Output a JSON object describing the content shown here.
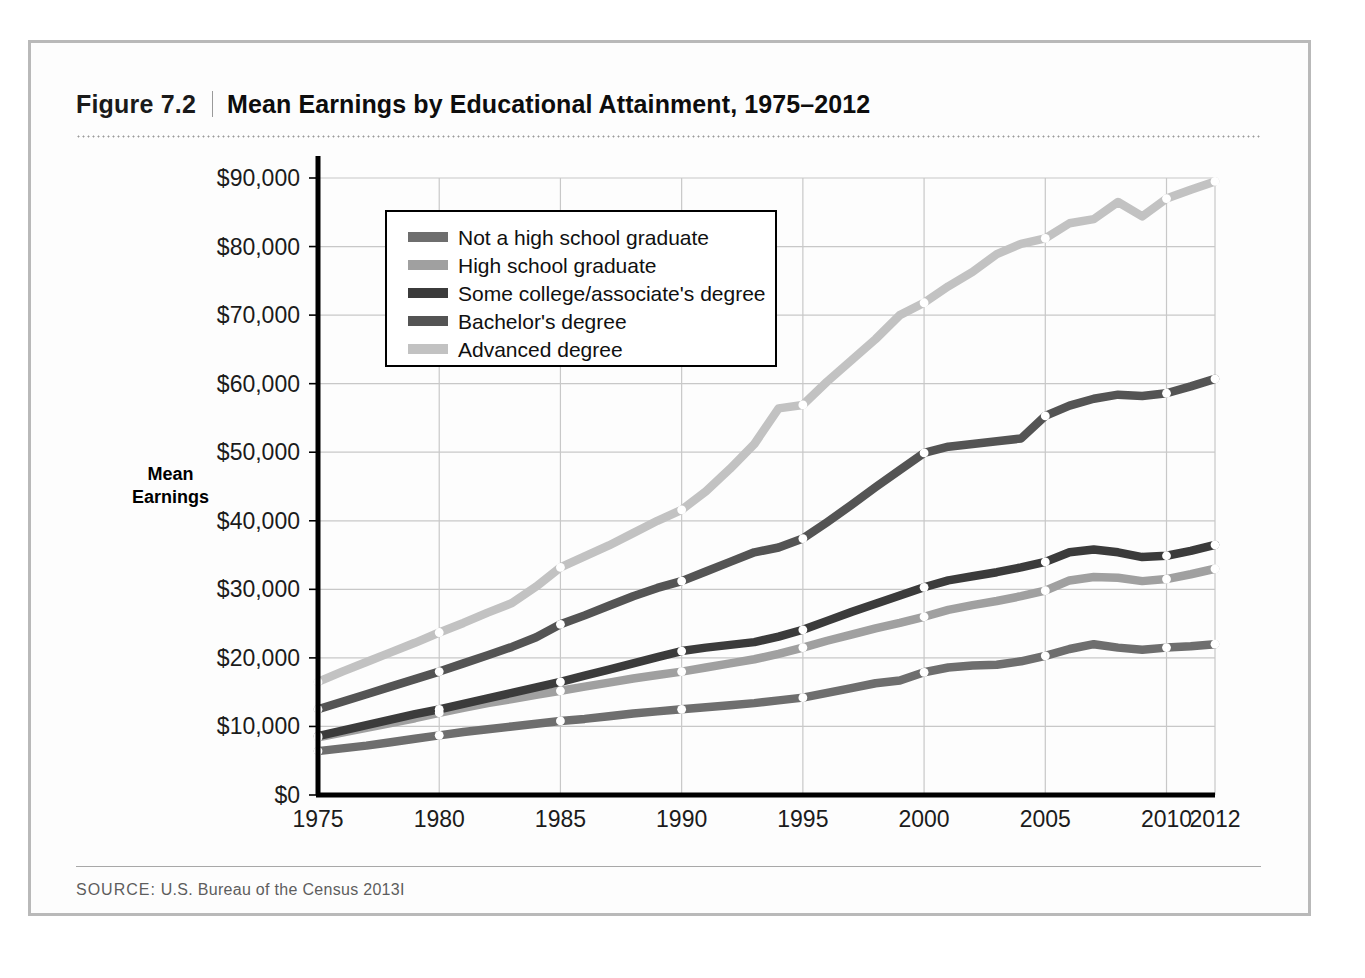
{
  "figure": {
    "number": "Figure 7.2",
    "title": "Mean Earnings by Educational Attainment, 1975–2012",
    "source_label": "SOURCE:",
    "source_text": " U.S. Bureau of the Census 2013I"
  },
  "axis": {
    "y_title_line1": "Mean",
    "y_title_line2": "Earnings"
  },
  "colors": {
    "not_hs": "#6e6e6e",
    "hs": "#a0a0a0",
    "some_college": "#3b3b3b",
    "bachelors": "#545454",
    "advanced": "#c2c2c2",
    "axis": "#000000",
    "grid": "#c8c8c8",
    "frame": "#b9b9b9",
    "marker": "#ffffff"
  },
  "chart_data": {
    "type": "line",
    "title": "Mean Earnings by Educational Attainment, 1975–2012",
    "xlabel": "",
    "ylabel": "Mean Earnings",
    "xlim": [
      1975,
      2012
    ],
    "ylim": [
      0,
      90000
    ],
    "grid": true,
    "legend_position": "upper-left-inside",
    "ytick_labels": [
      "$0",
      "$10,000",
      "$20,000",
      "$30,000",
      "$40,000",
      "$50,000",
      "$60,000",
      "$70,000",
      "$80,000",
      "$90,000"
    ],
    "ytick_values": [
      0,
      10000,
      20000,
      30000,
      40000,
      50000,
      60000,
      70000,
      80000,
      90000
    ],
    "xtick_labels": [
      "1975",
      "1980",
      "1985",
      "1990",
      "1995",
      "2000",
      "2005",
      "2010",
      "2012"
    ],
    "xtick_values": [
      1975,
      1980,
      1985,
      1990,
      1995,
      2000,
      2005,
      2010,
      2012
    ],
    "marker_years": [
      1975,
      1980,
      1985,
      1990,
      1995,
      2000,
      2005,
      2010,
      2012
    ],
    "x": [
      1975,
      1976,
      1977,
      1978,
      1979,
      1980,
      1981,
      1982,
      1983,
      1984,
      1985,
      1986,
      1987,
      1988,
      1989,
      1990,
      1991,
      1992,
      1993,
      1994,
      1995,
      1996,
      1997,
      1998,
      1999,
      2000,
      2001,
      2002,
      2003,
      2004,
      2005,
      2006,
      2007,
      2008,
      2009,
      2010,
      2011,
      2012
    ],
    "series": [
      {
        "name": "Not a high school graduate",
        "color": "#6e6e6e",
        "values": [
          6400,
          6800,
          7200,
          7700,
          8200,
          8700,
          9200,
          9600,
          10000,
          10400,
          10800,
          11100,
          11500,
          11900,
          12200,
          12500,
          12800,
          13100,
          13400,
          13800,
          14200,
          14900,
          15600,
          16300,
          16700,
          17900,
          18600,
          18900,
          19000,
          19500,
          20300,
          21300,
          22000,
          21500,
          21200,
          21500,
          21700,
          22000
        ]
      },
      {
        "name": "High school graduate",
        "color": "#a0a0a0",
        "values": [
          8400,
          9100,
          9800,
          10500,
          11200,
          12000,
          12700,
          13400,
          14000,
          14600,
          15200,
          15800,
          16400,
          17000,
          17500,
          18000,
          18600,
          19200,
          19800,
          20600,
          21500,
          22500,
          23400,
          24300,
          25100,
          26000,
          27000,
          27700,
          28300,
          29000,
          29800,
          31300,
          31800,
          31700,
          31200,
          31500,
          32200,
          33000
        ]
      },
      {
        "name": "Some college/associate's degree",
        "color": "#3b3b3b",
        "values": [
          8600,
          9400,
          10200,
          11000,
          11800,
          12500,
          13300,
          14100,
          14900,
          15700,
          16500,
          17400,
          18300,
          19200,
          20100,
          21000,
          21500,
          21900,
          22300,
          23100,
          24100,
          25400,
          26700,
          27900,
          29100,
          30300,
          31300,
          31900,
          32500,
          33200,
          34000,
          35400,
          35800,
          35400,
          34700,
          34900,
          35600,
          36500
        ]
      },
      {
        "name": "Bachelor's degree",
        "color": "#545454",
        "values": [
          12500,
          13600,
          14700,
          15800,
          16900,
          18000,
          19200,
          20400,
          21600,
          23000,
          24900,
          26200,
          27600,
          29000,
          30200,
          31200,
          32600,
          34000,
          35400,
          36100,
          37400,
          39800,
          42300,
          44900,
          47400,
          49900,
          50800,
          51200,
          51600,
          52000,
          55300,
          56800,
          57800,
          58400,
          58200,
          58600,
          59600,
          60700
        ]
      },
      {
        "name": "Advanced degree",
        "color": "#c2c2c2",
        "values": [
          16500,
          18000,
          19400,
          20800,
          22200,
          23700,
          25100,
          26600,
          28000,
          30400,
          33200,
          34800,
          36400,
          38200,
          40000,
          41600,
          44300,
          47600,
          51200,
          56400,
          56900,
          60300,
          63400,
          66500,
          70000,
          71800,
          74200,
          76300,
          78900,
          80400,
          81200,
          83400,
          84000,
          86500,
          84400,
          87000,
          88300,
          89500
        ]
      }
    ]
  },
  "legend": {
    "items": [
      {
        "label": "Not a high school graduate",
        "color": "#6e6e6e"
      },
      {
        "label": "High school graduate",
        "color": "#a0a0a0"
      },
      {
        "label": "Some college/associate's degree",
        "color": "#3b3b3b"
      },
      {
        "label": "Bachelor's degree",
        "color": "#545454"
      },
      {
        "label": "Advanced degree",
        "color": "#c2c2c2"
      }
    ]
  }
}
